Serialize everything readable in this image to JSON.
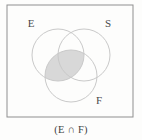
{
  "figure": {
    "type": "venn-diagram",
    "set_count": 3,
    "caption": "(E ∩ F)",
    "background_color": "#fdfdfc",
    "border_color": "#8f8f8f",
    "circle_stroke_color": "#c9c9c9",
    "shade_fill_color": "#d8d8d8",
    "label_color": "#4a4a4a",
    "universe_box": {
      "x": 7,
      "y": 5,
      "width": 126,
      "height": 112
    },
    "sets": [
      {
        "id": "E",
        "label": "E",
        "label_x": 31,
        "label_y": 27,
        "cx": 58,
        "cy": 55,
        "r": 26,
        "shaded": true
      },
      {
        "id": "S",
        "label": "S",
        "label_x": 108,
        "label_y": 27,
        "cx": 84,
        "cy": 55,
        "r": 26,
        "shaded": false
      },
      {
        "id": "F",
        "label": "F",
        "label_x": 99,
        "label_y": 104,
        "cx": 71,
        "cy": 76,
        "r": 26,
        "shaded": true
      }
    ],
    "shaded_region": {
      "expression": "E ∩ F",
      "description": "lens-shaped intersection of circle E and circle F"
    },
    "caption_x": 71,
    "caption_y": 133
  }
}
